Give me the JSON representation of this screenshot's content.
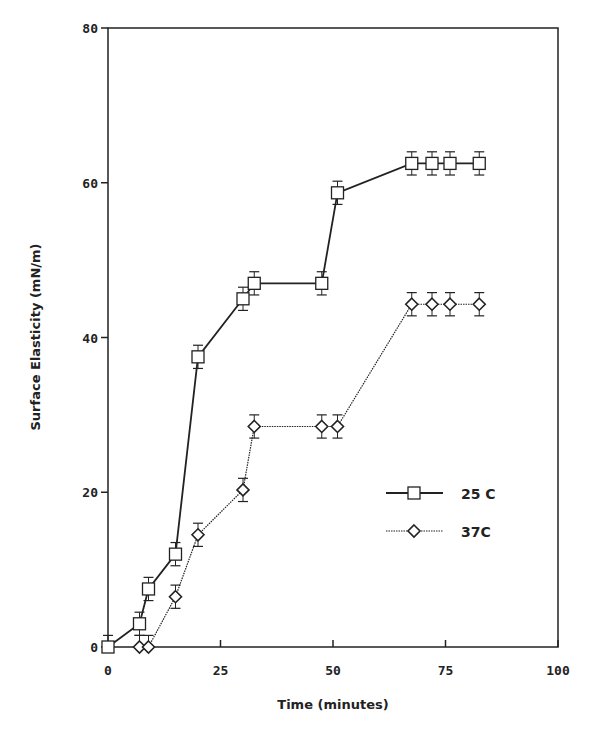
{
  "chart_data": {
    "type": "line",
    "title": "",
    "xlabel": "Time (minutes)",
    "ylabel": "Surface Elasticity (mN/m)",
    "xlim": [
      0,
      100
    ],
    "ylim": [
      0,
      80
    ],
    "xticks": [
      0,
      25,
      50,
      75,
      100
    ],
    "yticks": [
      0,
      20,
      40,
      60,
      80
    ],
    "xtick_labels": [
      "0",
      "25",
      "50",
      "75",
      "100"
    ],
    "ytick_labels": [
      "0",
      "20",
      "40",
      "60",
      "80"
    ],
    "grid": false,
    "legend_position": "lower right (inside plot)",
    "error_bar": 1.5,
    "series": [
      {
        "name": "25 C",
        "marker": "square",
        "line": "solid",
        "x": [
          0,
          7,
          9,
          15,
          20,
          30,
          32.5,
          47.5,
          51,
          67.5,
          72,
          76,
          82.5
        ],
        "values": [
          0,
          3,
          7.5,
          12,
          37.5,
          45,
          47,
          47,
          58.7,
          62.5,
          62.5,
          62.5,
          62.5
        ]
      },
      {
        "name": "37C",
        "marker": "diamond",
        "line": "dotted",
        "x": [
          7,
          9,
          15,
          20,
          30,
          32.5,
          47.5,
          51,
          67.5,
          72,
          76,
          82.5
        ],
        "values": [
          0,
          0,
          6.5,
          14.5,
          20.3,
          28.5,
          28.5,
          28.5,
          44.3,
          44.3,
          44.3,
          44.3
        ]
      }
    ]
  },
  "colors": {
    "ink": "#222222",
    "background": "#ffffff"
  }
}
